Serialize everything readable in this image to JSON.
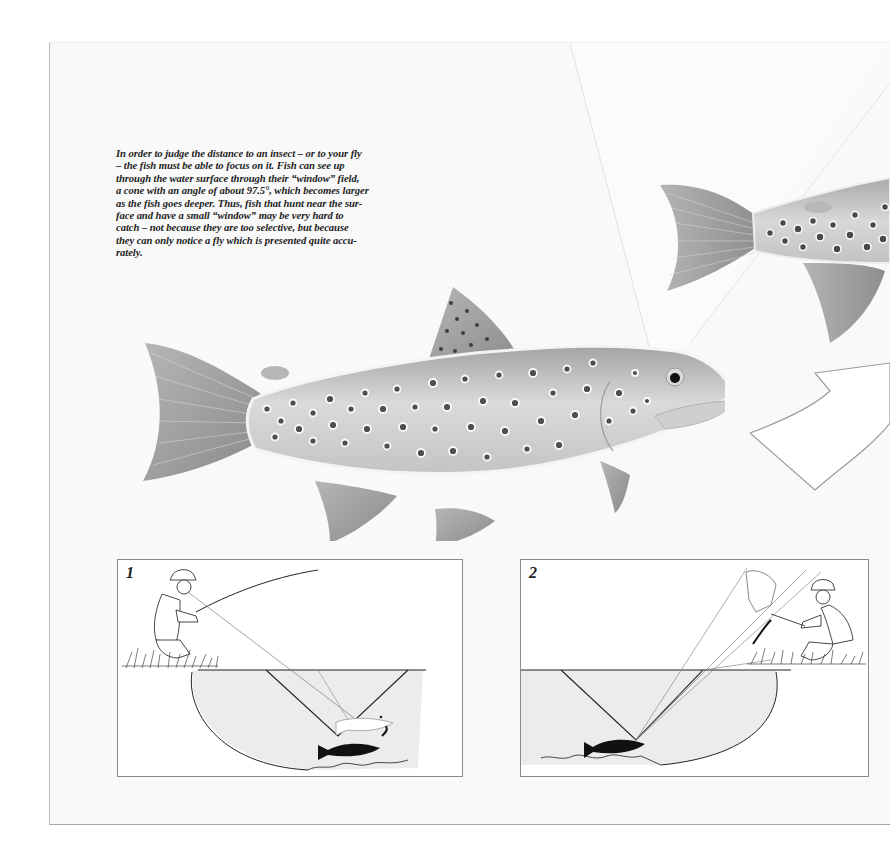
{
  "page": {
    "caption": "In order to judge the distance to an insect – or to your fly – the fish must be able to focus on it. Fish can see up through the water surface through their “window” field, a cone with an angle of about 97.5°, which becomes larger as the fish goes deeper. Thus, fish that hunt near the surface and have a small “window” may be very hard to catch – not because they are too selective, but because they can only notice a fly which is presented quite accurately.",
    "caption_lines": [
      "In order to judge the distance to an insect – or to your fly",
      "– the fish must be able to focus on it. Fish can see up",
      "through the water surface through their “window” field,",
      "a cone with an angle of about 97.5°, which becomes larger",
      "as the fish goes deeper. Thus, fish that hunt near the sur-",
      "face and have a small “window” may be very hard to",
      "catch – not because they are too selective, but because",
      "they can only notice a fly which is presented quite accu-",
      "rately."
    ],
    "window_angle": "97.5°"
  },
  "illustrations": {
    "main_fish": "brown-trout-illustration",
    "upper_fish": "brown-trout-partial-illustration",
    "arrow": "large-curved-arrow"
  },
  "panels": [
    {
      "number": "1",
      "description": "angler kneeling on bank casting; shallow fish rises toward fly; narrow window cone"
    },
    {
      "number": "2",
      "description": "fish lying deep; wide window cone; angler seen refracted above bank"
    }
  ],
  "colors": {
    "paper": "#f9f9f9",
    "ink": "#222222",
    "water": "#ededed",
    "fish_body": "#bdbdbd",
    "fin": "#a0a0a0",
    "spot": "#555555"
  }
}
